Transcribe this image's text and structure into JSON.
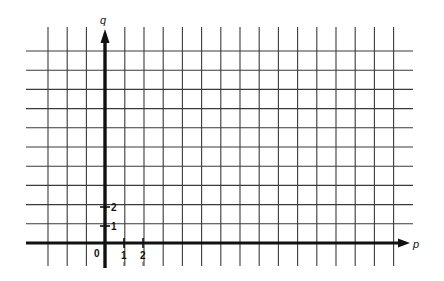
{
  "diagram": {
    "type": "coordinate-grid",
    "axes": {
      "x_label": "p",
      "y_label": "q",
      "origin_label": "0",
      "x_ticks": [
        "1",
        "2"
      ],
      "y_ticks": [
        "1",
        "2"
      ]
    },
    "grid": {
      "vertical_lines": 19,
      "horizontal_lines_above_axis": 10,
      "unit_px": 19.2
    },
    "colors": {
      "grid": "#3a3a3a",
      "axis": "#111111",
      "background": "#ffffff"
    }
  }
}
